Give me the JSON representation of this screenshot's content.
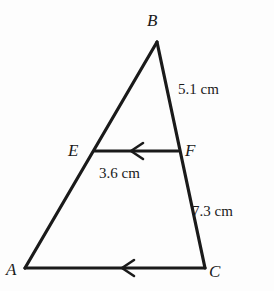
{
  "figure": {
    "type": "geometry-diagram",
    "background_color": "#fdfdfd",
    "stroke_color": "#1a1a1a",
    "vertices": [
      {
        "id": "B",
        "label": "B",
        "x": 157,
        "y": 42,
        "label_x": 147,
        "label_y": 12
      },
      {
        "id": "A",
        "label": "A",
        "x": 25,
        "y": 268,
        "label_x": 6,
        "label_y": 261
      },
      {
        "id": "C",
        "label": "C",
        "x": 205,
        "y": 268,
        "label_x": 209,
        "label_y": 263
      },
      {
        "id": "E",
        "label": "E",
        "x": 95,
        "y": 151,
        "label_x": 68,
        "label_y": 142
      },
      {
        "id": "F",
        "label": "F",
        "x": 178,
        "y": 151,
        "label_x": 185,
        "label_y": 142
      }
    ],
    "segments": [
      {
        "id": "BA",
        "from": "B",
        "to": "A",
        "arrow": false
      },
      {
        "id": "BC",
        "from": "B",
        "to": "C",
        "arrow": false
      },
      {
        "id": "AC",
        "from": "A",
        "to": "C",
        "arrow": true,
        "arrow_direction": "left"
      },
      {
        "id": "EF",
        "from": "E",
        "to": "F",
        "arrow": true,
        "arrow_direction": "left"
      }
    ],
    "measurements": [
      {
        "id": "bf",
        "segment": "BF",
        "text": "5.1 cm",
        "value": 5.1,
        "unit": "cm",
        "x": 178,
        "y": 82
      },
      {
        "id": "ef",
        "segment": "EF",
        "text": "3.6 cm",
        "value": 3.6,
        "unit": "cm",
        "x": 99,
        "y": 166
      },
      {
        "id": "fc",
        "segment": "FC",
        "text": "7.3 cm",
        "value": 7.3,
        "unit": "cm",
        "x": 192,
        "y": 204
      }
    ]
  }
}
